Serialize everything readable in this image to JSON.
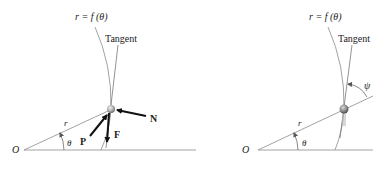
{
  "left_diagram": {
    "curve_label": "r = f (θ)",
    "tangent_label": "Tangent",
    "origin_label": "O",
    "radius_label": "r",
    "angle_label": "θ",
    "forces": [
      {
        "name": "N",
        "label": "N"
      },
      {
        "name": "P",
        "label": "P"
      },
      {
        "name": "F",
        "label": "F"
      }
    ]
  },
  "right_diagram": {
    "curve_label": "r = f (θ)",
    "tangent_label": "Tangent",
    "origin_label": "O",
    "radius_label": "r",
    "angle_label": "θ",
    "psi_label": "ψ"
  },
  "colors": {
    "line": "#8a8a8a",
    "dark_line": "#555555",
    "arrow": "#111111",
    "particle": "#9a9a9a",
    "text": "#222222"
  }
}
